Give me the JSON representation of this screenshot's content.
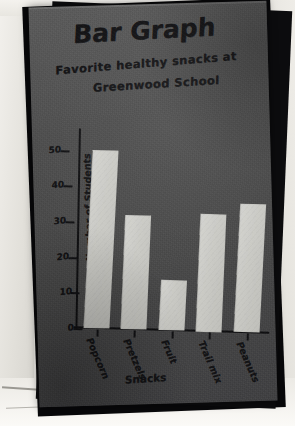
{
  "photo": {
    "description": "photograph-of-handmade-poster",
    "board_color": "#474747",
    "bar_color": "#c9c9c4",
    "ink_color": "#121214",
    "backdrop_color": "#e9e7e2"
  },
  "chart_data": {
    "type": "bar",
    "title": "Bar Graph",
    "subtitle_line1": "Favorite healthy snacks at",
    "subtitle_line2": "Greenwood School",
    "xlabel": "Snacks",
    "ylabel": "Number of Students",
    "categories": [
      "Popcorn",
      "Pretzels",
      "Fruit",
      "Trail mix",
      "Peanuts"
    ],
    "values": [
      50,
      32,
      14,
      33,
      36
    ],
    "ylim": [
      0,
      55
    ],
    "yticks": [
      0,
      10,
      20,
      30,
      40,
      50
    ],
    "ytick_labels": [
      "0",
      "10",
      "20",
      "30",
      "40",
      "50"
    ],
    "grid": false,
    "legend": null
  }
}
